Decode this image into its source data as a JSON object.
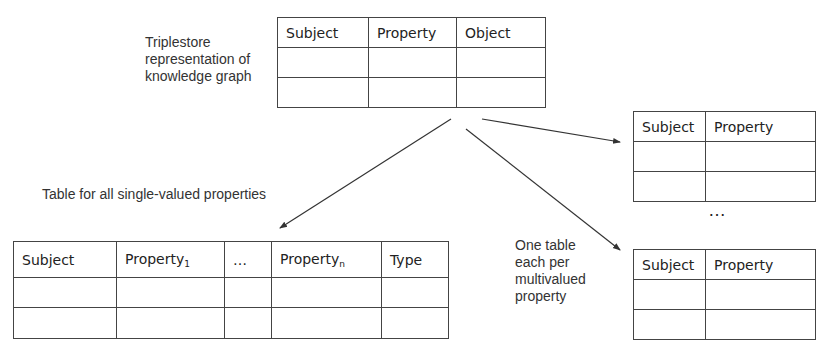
{
  "labels": {
    "triplestore": [
      "Triplestore",
      "representation of",
      "knowledge graph"
    ],
    "single_valued": "Table for all single-valued properties",
    "multivalued": [
      "One table",
      "each per",
      "multivalued",
      "property"
    ],
    "between_tables_ellipsis": "…"
  },
  "tables": {
    "triplestore": {
      "headers": [
        "Subject",
        "Property",
        "Object"
      ],
      "rows": [
        [
          "",
          "",
          ""
        ],
        [
          "",
          "",
          ""
        ]
      ]
    },
    "single_valued": {
      "headers": [
        "Subject",
        "Property",
        "…",
        "Property",
        "Type"
      ],
      "header_subscripts": [
        "",
        "1",
        "",
        "n",
        ""
      ],
      "rows": [
        [
          "",
          "",
          "",
          "",
          ""
        ],
        [
          "",
          "",
          "",
          "",
          ""
        ]
      ]
    },
    "multivalued_1": {
      "headers": [
        "Subject",
        "Property"
      ],
      "rows": [
        [
          "",
          ""
        ],
        [
          "",
          ""
        ]
      ]
    },
    "multivalued_n": {
      "headers": [
        "Subject",
        "Property"
      ],
      "rows": [
        [
          "",
          ""
        ],
        [
          "",
          ""
        ]
      ]
    }
  },
  "colors": {
    "line": "#444444",
    "text": "#222222",
    "arrow": "#333333"
  }
}
